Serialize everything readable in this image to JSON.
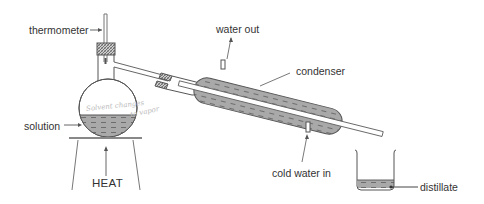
{
  "diagram": {
    "labels": {
      "thermometer": "thermometer",
      "water_out": "water out",
      "condenser": "condenser",
      "solution": "solution",
      "heat": "HEAT",
      "cold_water_in": "cold water in",
      "distillate": "distillate"
    },
    "handwritten_annotation": {
      "line1": "Solvent changes",
      "line2": "to vapor"
    },
    "components": [
      "thermometer",
      "stopper",
      "round-bottom-flask",
      "side-arm",
      "condenser",
      "water-jacket",
      "tripod-stand",
      "beaker"
    ],
    "colors": {
      "line": "#555555",
      "liquid_fill": "#a8a8a8",
      "stopper_hatch": "#777777",
      "text": "#333333"
    }
  }
}
